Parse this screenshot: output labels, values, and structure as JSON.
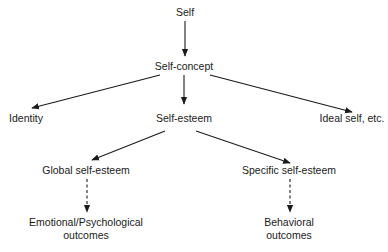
{
  "diagram": {
    "nodes": [
      {
        "id": "self",
        "label": "Self"
      },
      {
        "id": "self-concept",
        "label": "Self-concept"
      },
      {
        "id": "identity",
        "label": "Identity"
      },
      {
        "id": "self-esteem",
        "label": "Self-esteem"
      },
      {
        "id": "ideal-self",
        "label": "Ideal self, etc."
      },
      {
        "id": "global-self-esteem",
        "label": "Global self-esteem"
      },
      {
        "id": "specific-self-esteem",
        "label": "Specific self-esteem"
      },
      {
        "id": "emotional-outcomes",
        "line1": "Emotional/Psychological",
        "line2": "outcomes"
      },
      {
        "id": "behavioral-outcomes",
        "line1": "Behavioral",
        "line2": "outcomes"
      }
    ],
    "edges": [
      {
        "from": "self",
        "to": "self-concept",
        "style": "solid"
      },
      {
        "from": "self-concept",
        "to": "identity",
        "style": "solid"
      },
      {
        "from": "self-concept",
        "to": "self-esteem",
        "style": "solid"
      },
      {
        "from": "self-concept",
        "to": "ideal-self",
        "style": "solid"
      },
      {
        "from": "self-esteem",
        "to": "global-self-esteem",
        "style": "solid"
      },
      {
        "from": "self-esteem",
        "to": "specific-self-esteem",
        "style": "solid"
      },
      {
        "from": "global-self-esteem",
        "to": "emotional-outcomes",
        "style": "dashed"
      },
      {
        "from": "specific-self-esteem",
        "to": "behavioral-outcomes",
        "style": "dashed"
      }
    ]
  }
}
